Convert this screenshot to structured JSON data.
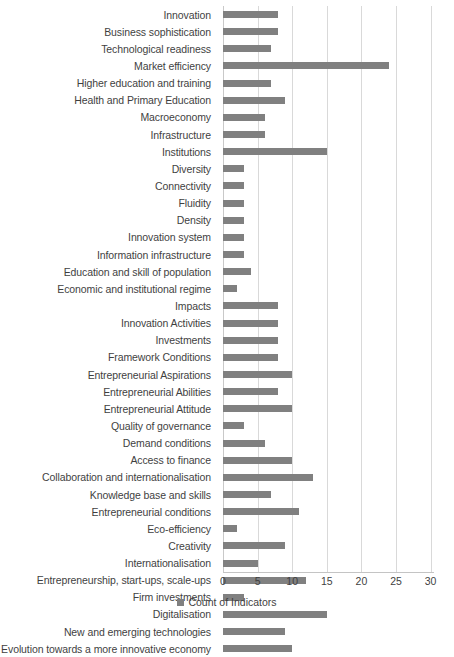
{
  "chart_data": {
    "type": "bar",
    "orientation": "horizontal",
    "title": "",
    "xlabel": "",
    "ylabel": "",
    "xlim": [
      0,
      30
    ],
    "xticks": [
      0,
      5,
      10,
      15,
      20,
      25,
      30
    ],
    "grid": true,
    "legend_position": "bottom",
    "series_name": "Count of Indicators",
    "bar_color": "#808080",
    "categories": [
      "Innovation",
      "Business sophistication",
      "Technological readiness",
      "Market efficiency",
      "Higher education and training",
      "Health and Primary Education",
      "Macroeconomy",
      "Infrastructure",
      "Institutions",
      "Diversity",
      "Connectivity",
      "Fluidity",
      "Density",
      "Innovation system",
      "Information infrastructure",
      "Education and skill of population",
      "Economic and institutional regime",
      "Impacts",
      "Innovation Activities",
      "Investments",
      "Framework Conditions",
      "Entrepreneurial Aspirations",
      "Entrepreneurial Abilities",
      "Entrepreneurial Attitude",
      "Quality of governance",
      "Demand conditions",
      "Access to finance",
      "Collaboration and internationalisation",
      "Knowledge base and skills",
      "Entrepreneurial conditions",
      "Eco-efficiency",
      "Creativity",
      "Internationalisation",
      "Entrepreneurship, start-ups, scale-ups",
      "Firm investments",
      "Digitalisation",
      "New and emerging technologies",
      "Evolution towards a more innovative economy"
    ],
    "values": [
      8,
      8,
      7,
      24,
      7,
      9,
      6,
      6,
      15,
      3,
      3,
      3,
      3,
      3,
      3,
      4,
      2,
      8,
      8,
      8,
      8,
      10,
      8,
      10,
      3,
      6,
      10,
      13,
      7,
      11,
      2,
      9,
      5,
      12,
      3,
      15,
      9,
      10
    ]
  },
  "legend": {
    "label": "Count of Indicators"
  }
}
